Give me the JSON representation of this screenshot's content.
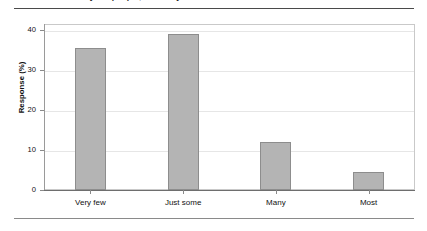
{
  "figure": {
    "title": "y the people, the many thousands are hostile toward Muslims",
    "title_visible_fragment": "y the people, the many thousands are hostile toward Muslims"
  },
  "chart_data": {
    "type": "bar",
    "title": "",
    "xlabel": "",
    "ylabel": "Response (%)",
    "categories": [
      "Very few",
      "Just some",
      "Many",
      "Most"
    ],
    "values": [
      35.5,
      39,
      12,
      4.5
    ],
    "ylim": [
      0,
      40
    ],
    "yticks": [
      0,
      10,
      20,
      30,
      40
    ],
    "ytick_labels": [
      "0",
      "10",
      "20",
      "30",
      "40"
    ],
    "grid": true,
    "legend": false,
    "bar_color": "#b4b4b4",
    "bar_edge_color": "#8d8d8d"
  }
}
